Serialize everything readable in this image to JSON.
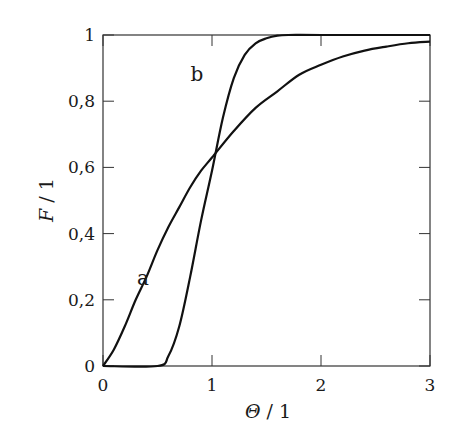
{
  "chart_data": {
    "type": "line",
    "title": "",
    "xlabel": "Θ / 1",
    "ylabel": "F / 1",
    "xlim": [
      0,
      3
    ],
    "ylim": [
      0,
      1
    ],
    "grid": false,
    "legend": "none (curves labelled inline)",
    "x_ticks": [
      "0",
      "1",
      "2",
      "3"
    ],
    "y_ticks": [
      "0",
      "0,2",
      "0,4",
      "0,6",
      "0,8",
      "1"
    ],
    "annotations": [
      {
        "text": "a",
        "x": 0.35,
        "y": 0.27
      },
      {
        "text": "b",
        "x": 0.95,
        "y": 0.93
      }
    ],
    "series": [
      {
        "name": "a",
        "x": [
          0,
          0.1,
          0.2,
          0.3,
          0.4,
          0.5,
          0.6,
          0.7,
          0.8,
          0.9,
          1.0,
          1.2,
          1.4,
          1.6,
          1.8,
          2.0,
          2.2,
          2.4,
          2.6,
          2.8,
          3.0
        ],
        "values": [
          0,
          0.05,
          0.12,
          0.2,
          0.27,
          0.35,
          0.42,
          0.48,
          0.54,
          0.59,
          0.63,
          0.71,
          0.78,
          0.83,
          0.88,
          0.91,
          0.935,
          0.953,
          0.965,
          0.975,
          0.98
        ]
      },
      {
        "name": "b",
        "x": [
          0,
          0.5,
          0.6,
          0.7,
          0.8,
          0.9,
          1.0,
          1.1,
          1.2,
          1.3,
          1.4,
          1.5,
          1.6,
          1.7,
          2.0,
          3.0
        ],
        "values": [
          0,
          0,
          0.03,
          0.12,
          0.27,
          0.44,
          0.59,
          0.75,
          0.87,
          0.94,
          0.975,
          0.99,
          0.998,
          1.0,
          1.0,
          1.0
        ]
      }
    ]
  }
}
